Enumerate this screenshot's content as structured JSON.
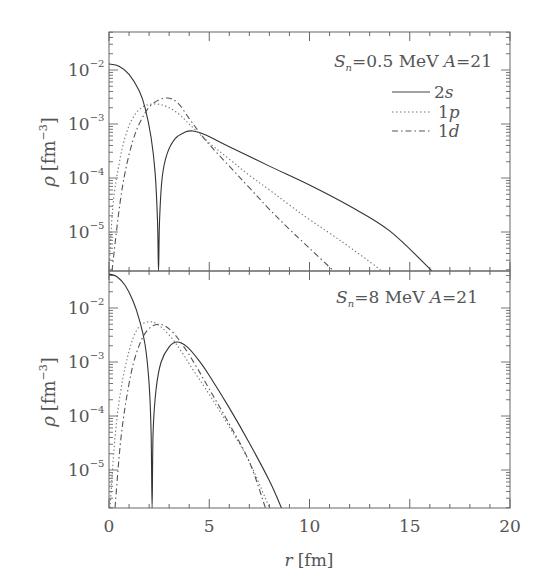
{
  "chart_data": [
    {
      "type": "line",
      "panel": "top",
      "annotation": {
        "sub_label": "S",
        "sub_index": "n",
        "text": "=0.5  MeV  ",
        "A_label": "A",
        "A_text": "=21"
      },
      "xlabel": "r [fm]",
      "ylabel": "ρ [fm⁻³]",
      "yscale": "log",
      "xlim": [
        0,
        20
      ],
      "ylim_log10": [
        -5.72,
        -1.3
      ],
      "x_ticks": [
        0,
        5,
        10,
        15,
        20
      ],
      "y_ticks": [
        "10^-2",
        "10^-3",
        "10^-4",
        "10^-5"
      ],
      "legend": [
        "2s",
        "1p",
        "1d"
      ],
      "series": [
        {
          "name": "2s",
          "style": "solid",
          "points_log10": [
            [
              0,
              -1.89
            ],
            [
              0.5,
              -1.93
            ],
            [
              1.0,
              -2.08
            ],
            [
              1.5,
              -2.38
            ],
            [
              1.8,
              -2.7
            ],
            [
              2.1,
              -3.25
            ],
            [
              2.3,
              -3.9
            ],
            [
              2.42,
              -4.8
            ],
            [
              2.47,
              -5.72
            ],
            [
              2.52,
              -4.8
            ],
            [
              2.65,
              -4.0
            ],
            [
              2.9,
              -3.55
            ],
            [
              3.3,
              -3.27
            ],
            [
              3.8,
              -3.15
            ],
            [
              4.2,
              -3.13
            ],
            [
              4.8,
              -3.2
            ],
            [
              6,
              -3.42
            ],
            [
              8,
              -3.78
            ],
            [
              10,
              -4.13
            ],
            [
              12,
              -4.52
            ],
            [
              14,
              -4.98
            ],
            [
              16.1,
              -5.72
            ]
          ]
        },
        {
          "name": "1p",
          "style": "dotted",
          "points_log10": [
            [
              0,
              -5.72
            ],
            [
              0.2,
              -4.5
            ],
            [
              0.5,
              -3.75
            ],
            [
              0.8,
              -3.25
            ],
            [
              1.2,
              -2.88
            ],
            [
              1.7,
              -2.68
            ],
            [
              2.3,
              -2.63
            ],
            [
              2.9,
              -2.68
            ],
            [
              3.5,
              -2.82
            ],
            [
              4.0,
              -3.0
            ],
            [
              5,
              -3.35
            ],
            [
              6,
              -3.65
            ],
            [
              7,
              -3.95
            ],
            [
              8,
              -4.22
            ],
            [
              9,
              -4.5
            ],
            [
              10,
              -4.77
            ],
            [
              11,
              -5.02
            ],
            [
              12,
              -5.28
            ],
            [
              13,
              -5.55
            ],
            [
              13.6,
              -5.72
            ]
          ]
        },
        {
          "name": "1d",
          "style": "dashdot",
          "points_log10": [
            [
              0.15,
              -5.72
            ],
            [
              0.5,
              -4.6
            ],
            [
              0.8,
              -3.9
            ],
            [
              1.2,
              -3.3
            ],
            [
              1.6,
              -2.93
            ],
            [
              2.1,
              -2.65
            ],
            [
              2.8,
              -2.52
            ],
            [
              3.4,
              -2.6
            ],
            [
              4.0,
              -2.9
            ],
            [
              4.5,
              -3.15
            ],
            [
              5,
              -3.38
            ],
            [
              6,
              -3.78
            ],
            [
              7,
              -4.18
            ],
            [
              8,
              -4.58
            ],
            [
              9,
              -4.95
            ],
            [
              10,
              -5.3
            ],
            [
              11.2,
              -5.72
            ]
          ]
        }
      ]
    },
    {
      "type": "line",
      "panel": "bottom",
      "annotation": {
        "sub_label": "S",
        "sub_index": "n",
        "text": "=8  MeV  ",
        "A_label": "A",
        "A_text": "=21"
      },
      "xlabel": "r [fm]",
      "ylabel": "ρ [fm⁻³]",
      "yscale": "log",
      "xlim": [
        0,
        20
      ],
      "ylim_log10": [
        -5.7,
        -1.31
      ],
      "x_ticks": [
        0,
        5,
        10,
        15,
        20
      ],
      "y_ticks": [
        "10^-2",
        "10^-3",
        "10^-4",
        "10^-5"
      ],
      "series": [
        {
          "name": "2s",
          "style": "solid",
          "points_log10": [
            [
              0,
              -1.37
            ],
            [
              0.4,
              -1.42
            ],
            [
              0.8,
              -1.58
            ],
            [
              1.2,
              -1.87
            ],
            [
              1.5,
              -2.2
            ],
            [
              1.8,
              -2.68
            ],
            [
              2.0,
              -3.4
            ],
            [
              2.1,
              -4.3
            ],
            [
              2.15,
              -5.7
            ],
            [
              2.2,
              -4.3
            ],
            [
              2.35,
              -3.5
            ],
            [
              2.6,
              -3.0
            ],
            [
              3.0,
              -2.72
            ],
            [
              3.4,
              -2.63
            ],
            [
              3.9,
              -2.72
            ],
            [
              4.5,
              -2.98
            ],
            [
              5,
              -3.25
            ],
            [
              6,
              -3.85
            ],
            [
              7,
              -4.5
            ],
            [
              8,
              -5.2
            ],
            [
              8.6,
              -5.7
            ]
          ]
        },
        {
          "name": "1p",
          "style": "dotted",
          "points_log10": [
            [
              0.05,
              -5.7
            ],
            [
              0.3,
              -4.4
            ],
            [
              0.6,
              -3.5
            ],
            [
              1.0,
              -2.8
            ],
            [
              1.4,
              -2.4
            ],
            [
              1.9,
              -2.26
            ],
            [
              2.4,
              -2.3
            ],
            [
              3.0,
              -2.5
            ],
            [
              3.6,
              -2.8
            ],
            [
              4.2,
              -3.15
            ],
            [
              5,
              -3.6
            ],
            [
              6,
              -4.2
            ],
            [
              7,
              -4.85
            ],
            [
              8.0,
              -5.7
            ]
          ]
        },
        {
          "name": "1d",
          "style": "dashdot",
          "points_log10": [
            [
              0.3,
              -5.7
            ],
            [
              0.6,
              -4.4
            ],
            [
              1.0,
              -3.4
            ],
            [
              1.4,
              -2.8
            ],
            [
              1.9,
              -2.42
            ],
            [
              2.5,
              -2.3
            ],
            [
              3.1,
              -2.42
            ],
            [
              3.7,
              -2.7
            ],
            [
              4.3,
              -3.05
            ],
            [
              5,
              -3.5
            ],
            [
              6,
              -4.15
            ],
            [
              7,
              -4.85
            ],
            [
              7.8,
              -5.7
            ]
          ]
        }
      ]
    }
  ],
  "labels": {
    "ylabel_rho": "ρ",
    "ylabel_unit_open": "[fm",
    "ylabel_exp": "−3",
    "ylabel_unit_close": "]",
    "xlabel_r": "r",
    "xlabel_unit": "[fm]",
    "legend_2s_num": "2",
    "legend_2s_l": "s",
    "legend_1p_num": "1",
    "legend_1p_l": "p",
    "legend_1d_num": "1",
    "legend_1d_l": "d"
  }
}
